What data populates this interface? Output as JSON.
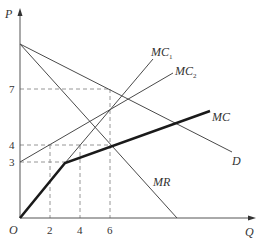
{
  "diagram": {
    "type": "economics-cost-curves",
    "axes": {
      "x_label": "Q",
      "y_label": "P",
      "origin_label": "O",
      "x_ticks": [
        "2",
        "4",
        "6"
      ],
      "y_ticks": [
        "3",
        "4",
        "7"
      ]
    },
    "curves": {
      "demand": "D",
      "marginal_revenue": "MR",
      "mc1": "MC",
      "mc1_sub": "1",
      "mc2": "MC",
      "mc2_sub": "2",
      "mc_total": "MC"
    },
    "colors": {
      "line": "#4a4a4a",
      "thick": "#1a1a1a",
      "dash": "#888888"
    }
  }
}
